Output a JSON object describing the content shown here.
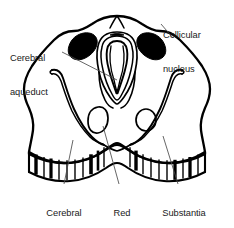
{
  "figure": {
    "name": "midbrain-cross-section",
    "background_color": "#ffffff",
    "ink_color": "#000000",
    "text_color": "#1a1a1a"
  },
  "labels": [
    {
      "id": "cerebral-aqueduct",
      "line1": "Cerebral",
      "line2": "aqueduct",
      "position": "top-left",
      "points_to": "cerebral-aqueduct-structure"
    },
    {
      "id": "collicular-nucleus",
      "line1": "Collicular",
      "line2": "nucleus",
      "position": "top-right",
      "points_to": "collicular-nucleus-right"
    },
    {
      "id": "cerebral-peduncle",
      "line1": "Cerebral",
      "line2": "peduncle",
      "position": "bottom-left",
      "points_to": "cerebral-peduncle-structure"
    },
    {
      "id": "red-nucleus",
      "line1": "Red",
      "line2": "nucleus",
      "position": "bottom-center",
      "points_to": "red-nucleus-left"
    },
    {
      "id": "substantia-nigra",
      "line1": "Substantia",
      "line2": "nigra",
      "position": "bottom-right",
      "points_to": "substantia-nigra-right"
    }
  ],
  "structures": [
    {
      "id": "midbrain-outline",
      "name": "midbrain outline",
      "fill": "none",
      "stroke": "#000000"
    },
    {
      "id": "cerebral-aqueduct",
      "name": "cerebral aqueduct",
      "fill": "none",
      "stroke": "#000000"
    },
    {
      "id": "collicular-nucleus-left",
      "name": "collicular nucleus left",
      "fill": "#000000",
      "stroke": "#000000"
    },
    {
      "id": "collicular-nucleus-right",
      "name": "collicular nucleus right",
      "fill": "#000000",
      "stroke": "#000000"
    },
    {
      "id": "red-nucleus-left",
      "name": "red nucleus left",
      "fill": "none",
      "stroke": "#000000"
    },
    {
      "id": "red-nucleus-right",
      "name": "red nucleus right",
      "fill": "none",
      "stroke": "#000000"
    },
    {
      "id": "substantia-nigra-left",
      "name": "substantia nigra left",
      "fill": "none",
      "stroke": "#000000"
    },
    {
      "id": "substantia-nigra-right",
      "name": "substantia nigra right",
      "fill": "none",
      "stroke": "#000000"
    },
    {
      "id": "cerebral-peduncle",
      "name": "cerebral peduncle band",
      "fill": "none",
      "stroke": "#000000"
    }
  ]
}
